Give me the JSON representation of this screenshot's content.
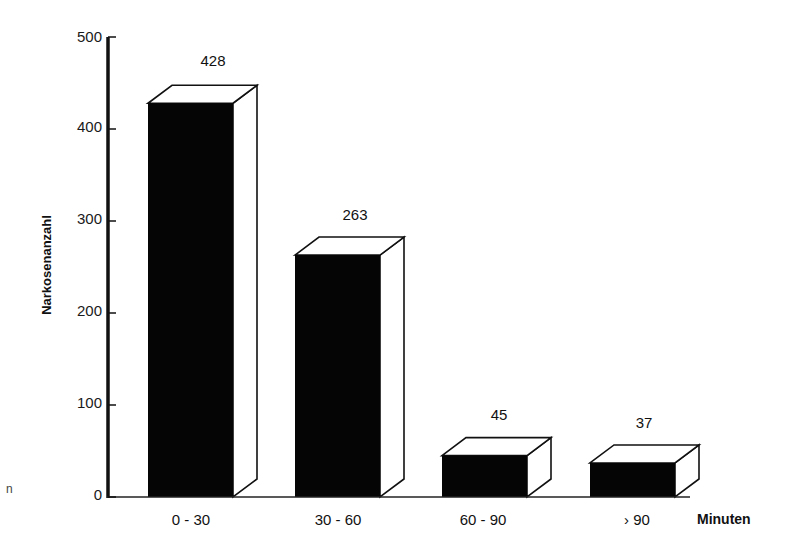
{
  "chart_data": {
    "type": "bar",
    "style": "3d-bar",
    "title": "",
    "xlabel": "Minuten",
    "ylabel": "Narkosenanzahl",
    "categories": [
      "0 - 30",
      "30 - 60",
      "60 - 90",
      "› 90"
    ],
    "values": [
      428,
      263,
      45,
      37
    ],
    "value_labels": [
      "428",
      "263",
      "45",
      "37"
    ],
    "ylim": [
      0,
      500
    ],
    "yticks": [
      0,
      100,
      200,
      300,
      400,
      500
    ],
    "ytick_labels": [
      "0",
      "100",
      "200",
      "300",
      "400",
      "500"
    ],
    "grid": false,
    "legend": null,
    "colors": {
      "bar_front": "#050505",
      "bar_side": "#ffffff",
      "outline": "#111111"
    }
  },
  "axis": {
    "y_title": "Narkosenanzahl",
    "x_unit": "Minuten",
    "y_ticks": [
      {
        "label": "500",
        "value": 500
      },
      {
        "label": "400",
        "value": 400
      },
      {
        "label": "300",
        "value": 300
      },
      {
        "label": "200",
        "value": 200
      },
      {
        "label": "100",
        "value": 100
      },
      {
        "label": "0",
        "value": 0
      }
    ]
  },
  "bars": [
    {
      "category": "0 - 30",
      "value_label": "428"
    },
    {
      "category": "30 - 60",
      "value_label": "263"
    },
    {
      "category": "60 - 90",
      "value_label": "45"
    },
    {
      "category": "› 90",
      "value_label": "37"
    }
  ],
  "stray_mark": "n"
}
